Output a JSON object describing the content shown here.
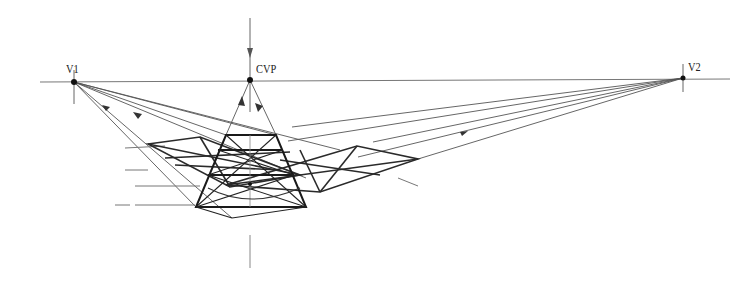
{
  "diagram": {
    "labels": {
      "v1": "V1",
      "cvp": "CVP",
      "v2": "V2"
    },
    "points": {
      "v1": [
        74,
        82
      ],
      "cvp": [
        250,
        80
      ],
      "v2": [
        683,
        78
      ]
    },
    "horizon_y": 80,
    "colors": {
      "ink": "#1a1a1a",
      "construction": "#555555",
      "light": "#8a8a8a",
      "background": "#ffffff"
    }
  }
}
